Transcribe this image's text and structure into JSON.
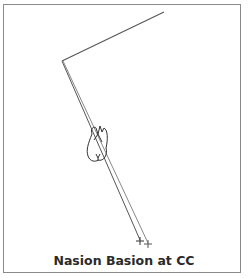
{
  "figure": {
    "caption": "Nasion Basion at CC",
    "line_color": "#555555",
    "border_color": "#8a8a8a",
    "points": {
      "vertex": [
        62,
        61
      ],
      "upper_end": [
        164,
        12
      ],
      "cross_1": [
        140,
        241
      ],
      "cross_2": [
        148,
        244
      ]
    },
    "icons": [
      "tooth-icon",
      "cross-marker-icon",
      "cross-marker-icon"
    ]
  }
}
